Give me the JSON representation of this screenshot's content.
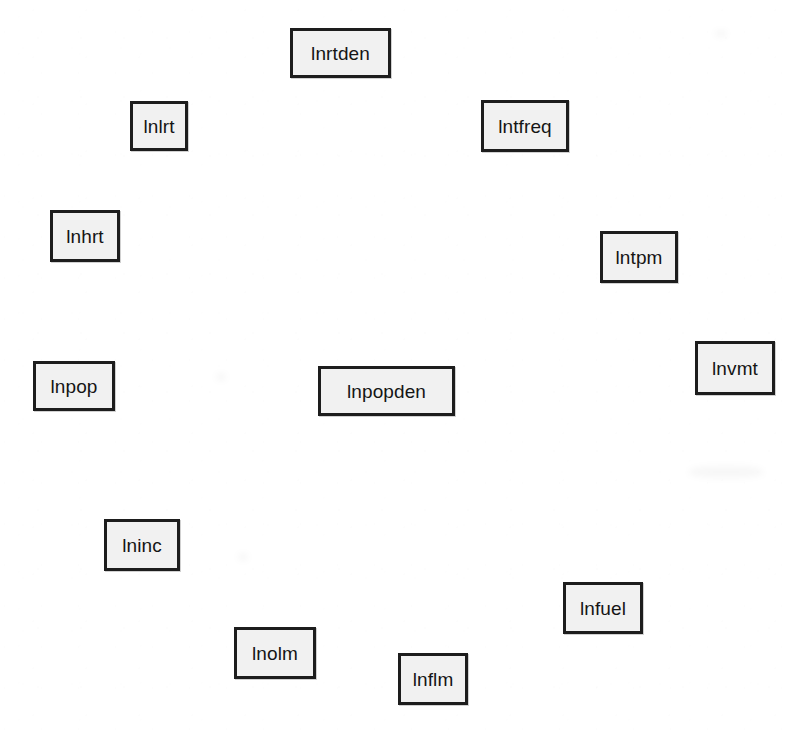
{
  "diagram": {
    "background_color": "#ffffff",
    "node_fill_color": "#f1f1f1",
    "node_border_color": "#1d1d1d",
    "node_text_color": "#151515",
    "layout": "circular",
    "node_count": 12,
    "nodes": [
      {
        "id": "lnrtden",
        "label": "lnrtden",
        "x": 290,
        "y": 28,
        "w": 101,
        "h": 50
      },
      {
        "id": "lnlrt",
        "label": "lnlrt",
        "x": 130,
        "y": 101,
        "w": 58,
        "h": 50
      },
      {
        "id": "lntfreq",
        "label": "lntfreq",
        "x": 481,
        "y": 100,
        "w": 88,
        "h": 52
      },
      {
        "id": "lnhrt",
        "label": "lnhrt",
        "x": 50,
        "y": 210,
        "w": 70,
        "h": 52
      },
      {
        "id": "lntpm",
        "label": "lntpm",
        "x": 600,
        "y": 231,
        "w": 78,
        "h": 52
      },
      {
        "id": "lnvmt",
        "label": "lnvmt",
        "x": 695,
        "y": 341,
        "w": 80,
        "h": 54
      },
      {
        "id": "lnpop",
        "label": "lnpop",
        "x": 33,
        "y": 361,
        "w": 82,
        "h": 50
      },
      {
        "id": "lnpopden",
        "label": "lnpopden",
        "x": 318,
        "y": 366,
        "w": 137,
        "h": 50
      },
      {
        "id": "lninc",
        "label": "lninc",
        "x": 104,
        "y": 519,
        "w": 76,
        "h": 52
      },
      {
        "id": "lnfuel",
        "label": "lnfuel",
        "x": 563,
        "y": 582,
        "w": 80,
        "h": 52
      },
      {
        "id": "lnolm",
        "label": "lnolm",
        "x": 234,
        "y": 627,
        "w": 82,
        "h": 52
      },
      {
        "id": "lnflm",
        "label": "lnflm",
        "x": 398,
        "y": 653,
        "w": 70,
        "h": 52
      }
    ],
    "smudges": [
      {
        "x": 216,
        "y": 373,
        "w": 10,
        "h": 8
      },
      {
        "x": 238,
        "y": 553,
        "w": 10,
        "h": 8
      },
      {
        "x": 689,
        "y": 466,
        "w": 74,
        "h": 12
      },
      {
        "x": 715,
        "y": 30,
        "w": 12,
        "h": 7
      }
    ]
  }
}
